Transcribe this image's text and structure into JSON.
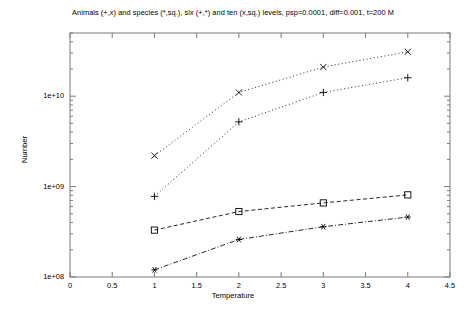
{
  "chart_data": {
    "type": "line",
    "title": "Animals (+,x) and species (*,sq.), six (+,*) and ten (x,sq.) levels, psp=0.0001, diff=0.001, t=200 M",
    "xlabel": "Temperature",
    "ylabel": "Number",
    "yscale": "log",
    "xlim": [
      0,
      4.5
    ],
    "ylim": [
      100000000,
      50000000000
    ],
    "grid": false,
    "legend": "none",
    "x": [
      1,
      2,
      3,
      4
    ],
    "xticks": [
      "0",
      "0.5",
      "1",
      "1.5",
      "2",
      "2.5",
      "3",
      "3.5",
      "4",
      "4.5"
    ],
    "xtick_values": [
      0,
      0.5,
      1,
      1.5,
      2,
      2.5,
      3,
      3.5,
      4,
      4.5
    ],
    "yticks": [
      "1e+08",
      "1e+09",
      "1e+10"
    ],
    "ytick_values": [
      100000000,
      1000000000,
      10000000000
    ],
    "series": [
      {
        "name": "Animals, ten levels",
        "marker": "x",
        "linestyle": "dotted",
        "color": "#000000",
        "values": [
          2200000000,
          11000000000,
          21000000000,
          31000000000
        ]
      },
      {
        "name": "Animals, six levels",
        "marker": "+",
        "linestyle": "dotted",
        "color": "#000000",
        "values": [
          780000000,
          5200000000,
          11000000000,
          16000000000
        ]
      },
      {
        "name": "Species, ten levels",
        "marker": "square",
        "linestyle": "dashed",
        "color": "#000000",
        "values": [
          330000000,
          530000000,
          660000000,
          810000000
        ]
      },
      {
        "name": "Species, six levels",
        "marker": "asterisk",
        "linestyle": "dash-dot",
        "color": "#000000",
        "values": [
          120000000,
          260000000,
          360000000,
          460000000
        ]
      }
    ]
  }
}
